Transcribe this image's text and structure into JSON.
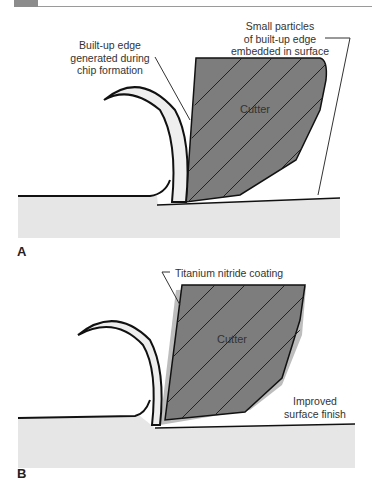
{
  "panels": [
    {
      "id": "A",
      "cutter_label": "Cutter",
      "callouts": [
        "Built-up edge\ngenerated during\nchip formation",
        "Small particles\nof built-up edge\nembedded in surface"
      ]
    },
    {
      "id": "B",
      "cutter_label": "Cutter",
      "callouts": [
        "Titanium nitride coating",
        "Improved\nsurface finish"
      ]
    }
  ],
  "colors": {
    "cutter": "#7d7d7d",
    "workpiece": "#e6e6e6",
    "chip": "#eeeeee",
    "coating": "#bdbdbd",
    "line": "#111111"
  }
}
